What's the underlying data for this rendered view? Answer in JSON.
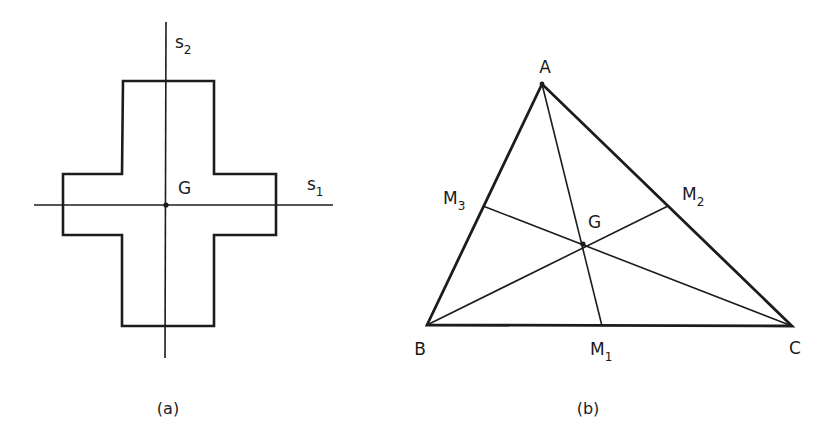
{
  "figure_a": {
    "caption": "(a)",
    "axis_vertical_label": "s",
    "axis_vertical_sub": "2",
    "axis_horizontal_label": "s",
    "axis_horizontal_sub": "1",
    "centroid_label": "G",
    "shape": "cross (plus-shaped cross-section)",
    "points": {
      "G": [
        166,
        205
      ],
      "s2_axis": [
        [
          166,
          22
        ],
        [
          166,
          358
        ]
      ],
      "s1_axis": [
        [
          34,
          205
        ],
        [
          333,
          205
        ]
      ],
      "cross_outline": [
        [
          123,
          81
        ],
        [
          214,
          81
        ],
        [
          214,
          174
        ],
        [
          276,
          174
        ],
        [
          276,
          235
        ],
        [
          214,
          235
        ],
        [
          214,
          326
        ],
        [
          122,
          326
        ],
        [
          122,
          235
        ],
        [
          63,
          235
        ],
        [
          63,
          174
        ],
        [
          122,
          174
        ],
        [
          123,
          81
        ]
      ]
    }
  },
  "figure_b": {
    "caption": "(b)",
    "vertices": {
      "A": {
        "label": "A",
        "pos": [
          542,
          84
        ]
      },
      "B": {
        "label": "B",
        "pos": [
          427,
          325
        ]
      },
      "C": {
        "label": "C",
        "pos": [
          792,
          326
        ]
      }
    },
    "midpoints": {
      "M1": {
        "label": "M",
        "sub": "1",
        "pos": [
          602,
          326
        ]
      },
      "M2": {
        "label": "M",
        "sub": "2",
        "pos": [
          668,
          206
        ]
      },
      "M3": {
        "label": "M",
        "sub": "3",
        "pos": [
          483,
          206
        ]
      }
    },
    "centroid": {
      "label": "G",
      "pos": [
        583,
        244
      ]
    },
    "medians": [
      [
        "A",
        "M1"
      ],
      [
        "B",
        "M2"
      ],
      [
        "C",
        "M3"
      ]
    ]
  },
  "colors": {
    "ink": "#1c1c1c",
    "background": "#ffffff"
  }
}
